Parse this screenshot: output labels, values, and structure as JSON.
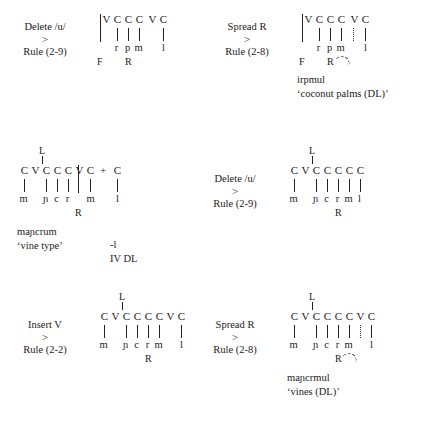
{
  "page": {
    "kind": "autosegmental-derivation-figure",
    "background_color": "#ffffff",
    "text_color": "#1a1a1a"
  },
  "arrow_glyph": ">",
  "plus_glyph": "+",
  "tiers": {
    "left": "L",
    "right": "R",
    "floating": "F"
  },
  "derivations": [
    {
      "id": "step-1",
      "rule": {
        "name": "Delete /u/",
        "arrow": ">",
        "reference": "Rule (2-9)"
      },
      "skeleton": [
        "V",
        "C",
        "C",
        "C",
        "V",
        "C"
      ],
      "segments": [
        "",
        "r",
        "p",
        "m",
        "",
        "l"
      ],
      "tier_top": "",
      "tier_bottom": [
        "F",
        "R"
      ],
      "output": {
        "form": "",
        "gloss": ""
      }
    },
    {
      "id": "step-2",
      "rule": {
        "name": "Spread R",
        "arrow": ">",
        "reference": "Rule (2-8)"
      },
      "skeleton": [
        "V",
        "C",
        "C",
        "C",
        "V",
        "C"
      ],
      "segments": [
        "",
        "r",
        "p",
        "m",
        "",
        "l"
      ],
      "tier_top": "",
      "tier_bottom": [
        "F",
        "R"
      ],
      "output": {
        "form": "irpmul",
        "gloss": "‘coconut palms (DL)’"
      }
    },
    {
      "id": "step-3",
      "rule": {
        "name": "Delete /u/",
        "arrow": ">",
        "reference": "Rule (2-9)"
      },
      "skeleton": [
        "C",
        "V",
        "C",
        "C",
        "C",
        "V",
        "C"
      ],
      "skeleton_extra": {
        "plus": "+",
        "slot": "C"
      },
      "segments": [
        "m",
        "",
        "ɲ",
        "c",
        "r",
        "",
        "m"
      ],
      "segments_extra": [
        "l"
      ],
      "tier_top": "L",
      "tier_bottom": [
        "R"
      ],
      "output": {
        "form": "maɲcrum",
        "gloss": "‘vine type’"
      },
      "annotation": [
        "-l",
        "IV DL"
      ]
    },
    {
      "id": "step-4",
      "rule": {
        "name": "Delete /u/",
        "arrow": ">",
        "reference": "Rule (2-9)"
      },
      "skeleton": [
        "C",
        "V",
        "C",
        "C",
        "C",
        "C",
        "C"
      ],
      "segments": [
        "m",
        "",
        "ɲ",
        "c",
        "r",
        "m",
        "l"
      ],
      "tier_top": "L",
      "tier_bottom": [
        "R"
      ],
      "output": {
        "form": "",
        "gloss": ""
      }
    },
    {
      "id": "step-5",
      "rule": {
        "name": "Insert V",
        "arrow": ">",
        "reference": "Rule (2-2)"
      },
      "skeleton": [
        "C",
        "V",
        "C",
        "C",
        "C",
        "C",
        "V",
        "C"
      ],
      "segments": [
        "m",
        "",
        "ɲ",
        "c",
        "r",
        "m",
        "",
        "l"
      ],
      "tier_top": "L",
      "tier_bottom": [
        "R"
      ],
      "output": {
        "form": "",
        "gloss": ""
      }
    },
    {
      "id": "step-6",
      "rule": {
        "name": "Spread R",
        "arrow": ">",
        "reference": "Rule (2-8)"
      },
      "skeleton": [
        "C",
        "V",
        "C",
        "C",
        "C",
        "C",
        "V",
        "C"
      ],
      "segments": [
        "m",
        "",
        "ɲ",
        "c",
        "r",
        "m",
        "",
        "l"
      ],
      "tier_top": "L",
      "tier_bottom": [
        "R"
      ],
      "output": {
        "form": "maɲcrmul",
        "gloss": "‘vines (DL)’"
      }
    }
  ]
}
